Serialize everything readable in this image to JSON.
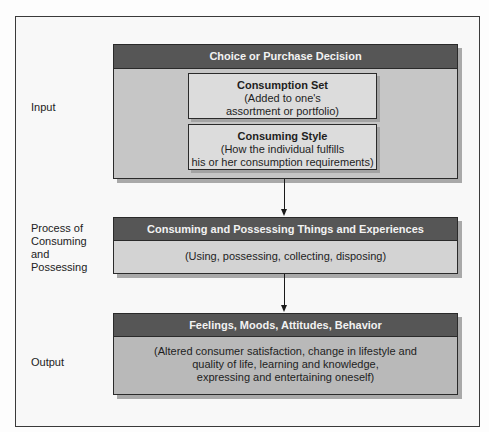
{
  "diagram": {
    "stages": [
      {
        "side_label": "Input",
        "header": "Choice or Purchase Decision",
        "inner_boxes": [
          {
            "title": "Consumption Set",
            "line1": "(Added to one's",
            "line2": "assortment or portfolio)"
          },
          {
            "title": "Consuming Style",
            "line1": "(How the individual fulfills",
            "line2": "his or her consumption requirements)"
          }
        ]
      },
      {
        "side_label_lines": [
          "Process of",
          "Consuming",
          "and",
          "Possessing"
        ],
        "header": "Consuming and Possessing Things and Experiences",
        "body": "(Using, possessing, collecting, disposing)"
      },
      {
        "side_label": "Output",
        "header": "Feelings, Moods, Attitudes, Behavior",
        "body_lines": [
          "(Altered consumer satisfaction, change in lifestyle and",
          "quality of life, learning and knowledge,",
          "expressing and entertaining oneself)"
        ]
      }
    ],
    "colors": {
      "header_bg": "#565656",
      "header_text": "#f2f2f2",
      "stage1_body": "#c6c6c6",
      "stage2_body": "#d3d3d3",
      "stage3_body": "#b9b9b9",
      "inner_box": "#dcdcdc",
      "shadow": "#a9a9a9"
    }
  }
}
